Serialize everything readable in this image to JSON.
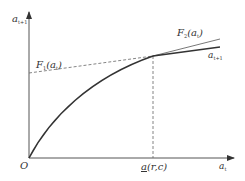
{
  "diagram": {
    "y_axis_label": {
      "base": "a",
      "sub": "t+1"
    },
    "x_axis_label": {
      "base": "a",
      "sub": "t"
    },
    "origin_label": "O",
    "tick_label": {
      "base": "a",
      "args": "(r,c)"
    },
    "curves": [
      {
        "name": "a_t+1 policy curve",
        "label": {
          "base": "a",
          "sub": "t+1"
        },
        "style": "solid-thick"
      },
      {
        "name": "F1 tangent line",
        "label": {
          "base": "F",
          "sub": "1",
          "arg": "a",
          "argsub": "t"
        },
        "style": "dashed"
      },
      {
        "name": "F2 tangent line",
        "label": {
          "base": "F",
          "sub": "2",
          "arg": "a",
          "argsub": "t"
        },
        "style": "solid-thin"
      }
    ],
    "colors": {
      "axis": "#555555",
      "curve": "#333333",
      "dashed": "#666666"
    }
  }
}
